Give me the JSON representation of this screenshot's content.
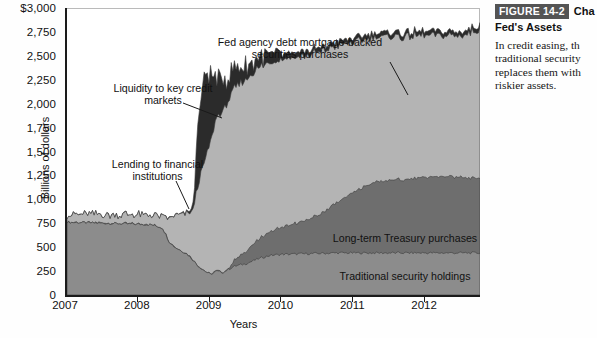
{
  "figure": {
    "badge": "FIGURE 14-2",
    "title_inline": "Cha",
    "title_line2": "Fed's Assets",
    "caption": "In credit easing, th\ntraditional security\nreplaces them with\nriskier assets."
  },
  "chart_data": {
    "type": "area",
    "stacked": true,
    "title": "",
    "xlabel": "Years",
    "ylabel": "Billions of dollars",
    "xlim": [
      2007.0,
      2012.75
    ],
    "ylim": [
      0,
      3000
    ],
    "grid": false,
    "legend_position": "inline-annotations",
    "ytick_labels": [
      "$3,000",
      "2,750",
      "2,500",
      "2,250",
      "2,000",
      "1,750",
      "1,500",
      "1,250",
      "1,000",
      "750",
      "500",
      "250",
      "0"
    ],
    "ytick_values": [
      3000,
      2750,
      2500,
      2250,
      2000,
      1750,
      1500,
      1250,
      1000,
      750,
      500,
      250,
      0
    ],
    "xtick_labels": [
      "2007",
      "2008",
      "2009",
      "2010",
      "2011",
      "2012"
    ],
    "xtick_values": [
      2007,
      2008,
      2009,
      2010,
      2011,
      2012
    ],
    "annotations": [
      {
        "name": "fed-agency-mbs",
        "text": "Fed agency debt mortgage-backed\nsecurities purchases"
      },
      {
        "name": "liquidity-key-credit",
        "text": "Liquidity to key credit\nmarkets"
      },
      {
        "name": "lending-financial-institutions",
        "text": "Lending to financial\ninstitutions"
      },
      {
        "name": "long-term-treasury",
        "text": "Long-term Treasury purchases"
      },
      {
        "name": "traditional-security",
        "text": "Traditional security holdings"
      }
    ],
    "x": [
      2007.0,
      2007.25,
      2007.5,
      2007.75,
      2008.0,
      2008.17,
      2008.33,
      2008.42,
      2008.5,
      2008.67,
      2008.75,
      2008.83,
      2008.92,
      2009.0,
      2009.08,
      2009.17,
      2009.25,
      2009.33,
      2009.5,
      2009.67,
      2009.83,
      2010.0,
      2010.25,
      2010.5,
      2010.75,
      2011.0,
      2011.25,
      2011.5,
      2011.75,
      2012.0,
      2012.25,
      2012.5,
      2012.75
    ],
    "series": [
      {
        "name": "Traditional security holdings",
        "color": "#8c8c8c",
        "values": [
          760,
          755,
          750,
          745,
          740,
          735,
          700,
          560,
          500,
          430,
          370,
          300,
          250,
          215,
          250,
          235,
          270,
          300,
          330,
          380,
          415,
          425,
          430,
          435,
          440,
          440,
          440,
          440,
          440,
          440,
          440,
          440,
          440
        ]
      },
      {
        "name": "Long-term Treasury purchases",
        "color": "#6e6e6e",
        "values": [
          0,
          0,
          0,
          0,
          0,
          0,
          0,
          0,
          0,
          0,
          0,
          0,
          0,
          0,
          0,
          0,
          10,
          60,
          130,
          200,
          250,
          290,
          330,
          400,
          520,
          640,
          730,
          760,
          770,
          790,
          800,
          790,
          780
        ]
      },
      {
        "name": "Fed agency debt mortgage-backed securities purchases",
        "color": "#b4b4b4",
        "values": [
          80,
          85,
          88,
          90,
          95,
          100,
          120,
          240,
          330,
          420,
          500,
          880,
          1150,
          1380,
          1600,
          1680,
          1760,
          1790,
          1800,
          1790,
          1770,
          1760,
          1730,
          1700,
          1640,
          1560,
          1520,
          1500,
          1490,
          1480,
          1470,
          1480,
          1560
        ]
      },
      {
        "name": "Liquidity to key credit markets",
        "color": "#2b2b2b",
        "values": [
          0,
          0,
          0,
          0,
          0,
          0,
          0,
          0,
          0,
          10,
          40,
          700,
          900,
          700,
          420,
          330,
          260,
          200,
          150,
          110,
          80,
          60,
          50,
          45,
          45,
          45,
          45,
          45,
          45,
          45,
          45,
          45,
          45
        ]
      }
    ],
    "total_top_values": [
      840,
      840,
      838,
      835,
      835,
      835,
      820,
      800,
      830,
      860,
      910,
      1880,
      2200,
      2295,
      2270,
      2245,
      2300,
      2350,
      2410,
      2480,
      2515,
      2535,
      2540,
      2580,
      2645,
      2685,
      2735,
      2745,
      2745,
      2755,
      2755,
      2755,
      2825
    ]
  }
}
